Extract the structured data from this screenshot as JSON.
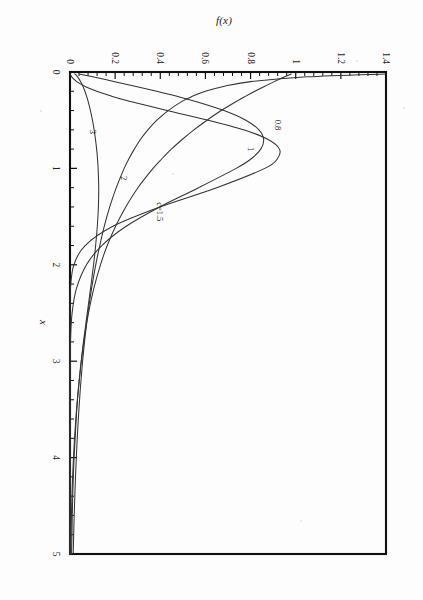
{
  "chart_data": {
    "type": "line",
    "title": "",
    "xlabel": "x",
    "ylabel": "f(x)",
    "xlim": [
      0,
      5
    ],
    "ylim": [
      0,
      1.4
    ],
    "xticks": [
      "0",
      "1",
      "2",
      "3",
      "4",
      "5"
    ],
    "xtick_values": [
      0,
      1,
      2,
      3,
      4,
      5
    ],
    "yticks": [
      "0",
      "0.2",
      "0.4",
      "0.6",
      "0.8",
      "1",
      "1.2",
      "1.4"
    ],
    "ytick_values": [
      0,
      0.2,
      0.4,
      0.6,
      0.8,
      1.0,
      1.2,
      1.4
    ],
    "minor_ticks_per_interval": 5,
    "grid": false,
    "legend": "inline-curve-labels",
    "orientation_on_page": "rotated-90-clockwise",
    "x": [
      0.02,
      0.05,
      0.1,
      0.15,
      0.2,
      0.25,
      0.3,
      0.4,
      0.5,
      0.6,
      0.7,
      0.8,
      0.9,
      1.0,
      1.2,
      1.4,
      1.6,
      1.8,
      2.0,
      2.25,
      2.5,
      2.75,
      3.0,
      3.25,
      3.5,
      3.75,
      4.0,
      4.25,
      4.5,
      4.75,
      5.0
    ],
    "series": [
      {
        "name": "c=0.8",
        "label": "0.8",
        "label_x": 0.55,
        "label_y": 0.92,
        "values": [
          1.41,
          1.05,
          0.8,
          0.68,
          0.6,
          0.545,
          0.5,
          0.435,
          0.385,
          0.345,
          0.312,
          0.285,
          0.261,
          0.24,
          0.205,
          0.176,
          0.152,
          0.132,
          0.114,
          0.0952,
          0.0795,
          0.0666,
          0.0559,
          0.0469,
          0.0395,
          0.0332,
          0.028,
          0.0236,
          0.0199,
          0.0168,
          0.0142
        ]
      },
      {
        "name": "c=1",
        "label": "1",
        "label_x": 0.8,
        "label_y": 0.8,
        "values": [
          0.98,
          0.951,
          0.905,
          0.861,
          0.819,
          0.779,
          0.741,
          0.67,
          0.607,
          0.549,
          0.497,
          0.449,
          0.407,
          0.368,
          0.301,
          0.247,
          0.202,
          0.165,
          0.135,
          0.105,
          0.082,
          0.064,
          0.05,
          0.039,
          0.03,
          0.024,
          0.018,
          0.014,
          0.011,
          0.009,
          0.007
        ]
      },
      {
        "name": "c=1.5",
        "label": "c=1.5",
        "label_x": 1.45,
        "label_y": 0.4,
        "values": [
          0.0212,
          0.0335,
          0.0473,
          0.0576,
          0.0661,
          0.0733,
          0.0797,
          0.0906,
          0.0995,
          0.1069,
          0.113,
          0.118,
          0.1218,
          0.1246,
          0.1272,
          0.1258,
          0.121,
          0.1136,
          0.1044,
          0.0908,
          0.0765,
          0.0625,
          0.0496,
          0.0384,
          0.029,
          0.0214,
          0.0154,
          0.0108,
          0.0074,
          0.005,
          0.0033
        ]
      },
      {
        "name": "c=2",
        "label": "2",
        "label_x": 1.1,
        "label_y": 0.24,
        "values": [
          0.04,
          0.1,
          0.198,
          0.293,
          0.384,
          0.47,
          0.549,
          0.682,
          0.779,
          0.837,
          0.858,
          0.845,
          0.803,
          0.736,
          0.57,
          0.397,
          0.249,
          0.141,
          0.073,
          0.028,
          0.0094,
          0.0028,
          0.00074,
          0.00017,
          4e-05,
          1e-05,
          0.0,
          0.0,
          0.0,
          0.0,
          0.0
        ]
      },
      {
        "name": "c=3",
        "label": "3",
        "label_x": 0.62,
        "label_y": 0.1,
        "values": [
          0.0012,
          0.0075,
          0.03,
          0.067,
          0.119,
          0.183,
          0.259,
          0.43,
          0.612,
          0.769,
          0.878,
          0.928,
          0.919,
          0.863,
          0.65,
          0.398,
          0.19,
          0.067,
          0.017,
          0.0018,
          9e-05,
          2e-06,
          0.0,
          0.0,
          0.0,
          0.0,
          0.0,
          0.0,
          0.0,
          0.0,
          0.0
        ]
      }
    ]
  },
  "figure": {
    "axis_titles": {
      "x": "x",
      "y": "f(x)"
    }
  },
  "colors": {
    "axis": "#111111",
    "curve": "#333333",
    "page": "#fdfdfd"
  }
}
